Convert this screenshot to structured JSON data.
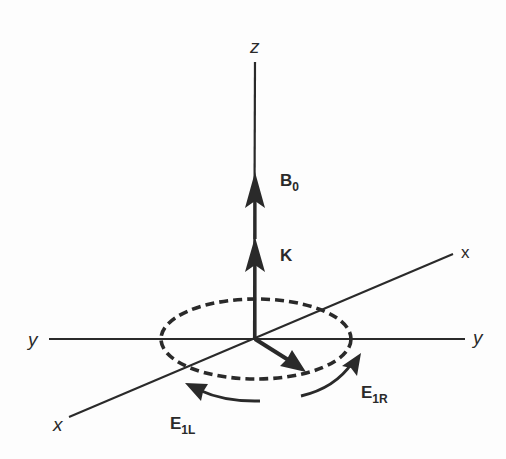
{
  "figure": {
    "type": "3D coordinate diagram",
    "axes": {
      "z": {
        "label": "z"
      },
      "y_left": {
        "label": "y"
      },
      "y_right": {
        "label": "y"
      },
      "x_front": {
        "label": "x"
      },
      "x_back": {
        "label": "x"
      }
    },
    "vectors": {
      "b0": {
        "label": "B",
        "subscript": "0"
      },
      "k": {
        "label": "K"
      },
      "e1r": {
        "label": "E",
        "subscript": "1R"
      },
      "e1l": {
        "label": "E",
        "subscript": "1L"
      }
    },
    "colors": {
      "ink": "#2a2a2a",
      "background": "#fdfdfd"
    }
  }
}
